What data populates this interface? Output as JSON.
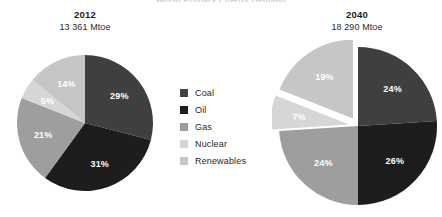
{
  "title": "World Primary Energy Demand",
  "colors": {
    "coal": "#3f3f3f",
    "oil": "#1d1d1d",
    "gas": "#9e9e9e",
    "nuclear": "#d6d6d6",
    "renewables": "#c6c6c6",
    "background": "#ffffff",
    "label_text": "#ffffff"
  },
  "legend": {
    "position": "center",
    "items": [
      {
        "label": "Coal",
        "color": "#3f3f3f"
      },
      {
        "label": "Oil",
        "color": "#1d1d1d"
      },
      {
        "label": "Gas",
        "color": "#9e9e9e"
      },
      {
        "label": "Nuclear",
        "color": "#d6d6d6"
      },
      {
        "label": "Renewables",
        "color": "#c6c6c6"
      }
    ]
  },
  "panels": [
    {
      "year": "2012",
      "total": "13 361 Mtoe"
    },
    {
      "year": "2040",
      "total": "18 290 Mtoe"
    }
  ],
  "chart_data": [
    {
      "type": "pie",
      "title": "2012",
      "subtitle": "13 361 Mtoe",
      "unit": "Mtoe",
      "total": 13361,
      "categories": [
        "Coal",
        "Oil",
        "Gas",
        "Nuclear",
        "Renewables"
      ],
      "values": [
        29,
        31,
        21,
        5,
        14
      ],
      "labels": [
        "29%",
        "31%",
        "21%",
        "5%",
        "14%"
      ],
      "colors": [
        "#3f3f3f",
        "#1d1d1d",
        "#9e9e9e",
        "#d6d6d6",
        "#c6c6c6"
      ],
      "exploded": [
        false,
        false,
        false,
        false,
        false
      ],
      "start_angle": 0,
      "legend": "shared"
    },
    {
      "type": "pie",
      "title": "2040",
      "subtitle": "18 290 Mtoe",
      "unit": "Mtoe",
      "total": 18290,
      "categories": [
        "Coal",
        "Oil",
        "Gas",
        "Nuclear",
        "Renewables"
      ],
      "values": [
        24,
        26,
        24,
        7,
        19
      ],
      "labels": [
        "24%",
        "26%",
        "24%",
        "7%",
        "19%"
      ],
      "colors": [
        "#3f3f3f",
        "#1d1d1d",
        "#9e9e9e",
        "#d6d6d6",
        "#c6c6c6"
      ],
      "exploded": [
        false,
        false,
        false,
        true,
        true
      ],
      "start_angle": 0,
      "legend": "shared"
    }
  ]
}
